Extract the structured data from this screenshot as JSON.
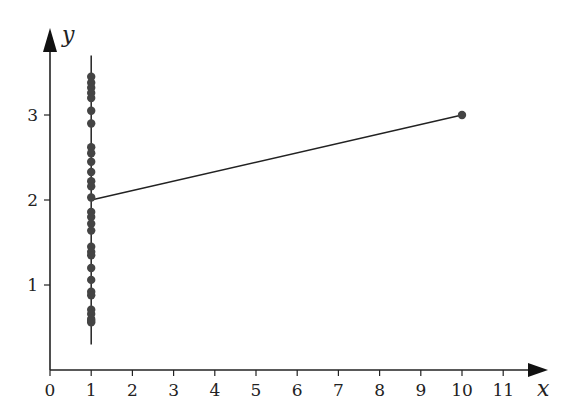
{
  "chart_data": {
    "type": "scatter",
    "title": "",
    "xlabel": "x",
    "ylabel": "y",
    "xlim": [
      0,
      11.5
    ],
    "ylim": [
      0,
      3.7
    ],
    "xticks": [
      0,
      1,
      2,
      3,
      4,
      5,
      6,
      7,
      8,
      9,
      10,
      11
    ],
    "yticks": [
      1,
      2,
      3
    ],
    "grid": false,
    "legend": null,
    "series": [
      {
        "name": "points at x=1",
        "type": "scatter",
        "x": [
          1,
          1,
          1,
          1,
          1,
          1,
          1,
          1,
          1,
          1,
          1,
          1,
          1,
          1,
          1,
          1,
          1,
          1,
          1,
          1,
          1,
          1,
          1,
          1,
          1,
          1,
          1,
          1,
          1,
          1
        ],
        "y": [
          3.45,
          3.38,
          3.32,
          3.26,
          3.2,
          3.05,
          2.9,
          2.62,
          2.55,
          2.45,
          2.33,
          2.22,
          2.16,
          2.03,
          1.86,
          1.8,
          1.72,
          1.64,
          1.45,
          1.39,
          1.35,
          1.2,
          1.06,
          0.92,
          0.88,
          0.71,
          0.66,
          0.6,
          0.56,
          0.58
        ]
      },
      {
        "name": "isolated point",
        "type": "scatter",
        "x": [
          10
        ],
        "y": [
          3
        ]
      },
      {
        "name": "segment",
        "type": "line",
        "x": [
          1,
          10
        ],
        "y": [
          2,
          3
        ]
      },
      {
        "name": "vertical line at x=1",
        "type": "line",
        "x": [
          1,
          1
        ],
        "y": [
          0.3,
          3.7
        ]
      }
    ]
  },
  "axes": {
    "x_label": "x",
    "y_label": "y",
    "x_tick_labels": [
      "0",
      "1",
      "2",
      "3",
      "4",
      "5",
      "6",
      "7",
      "8",
      "9",
      "10",
      "11"
    ],
    "y_tick_labels": [
      "1",
      "2",
      "3"
    ]
  }
}
